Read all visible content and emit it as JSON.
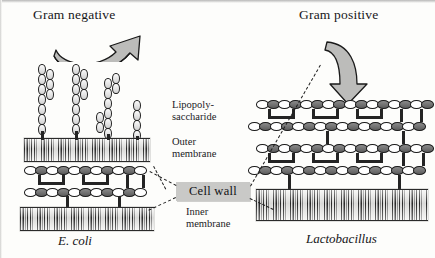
{
  "figure": {
    "titles": {
      "left": "Gram negative",
      "right": "Gram positive"
    },
    "species": {
      "left": "E. coli",
      "right": "Lactobacillus"
    },
    "labels": {
      "lipopolysaccharide_line1": "Lipopoly-",
      "lipopolysaccharide_line2": "saccharide",
      "outer_membrane_line1": "Outer",
      "outer_membrane_line2": "membrane",
      "cell_wall": "Cell wall",
      "inner_membrane_line1": "Inner",
      "inner_membrane_line2": "membrane"
    },
    "colors": {
      "background": "#fdfdfb",
      "ink": "#1b1b1e",
      "callout_box_fill": "#c9c9c7",
      "arrow_fill": "#b9b9b7",
      "sugar_dark": "#6e6e6e",
      "sugar_light": "#ffffff"
    },
    "structure": {
      "gram_negative_layers": [
        "lipopolysaccharide",
        "outer membrane",
        "peptidoglycan cell wall (thin)",
        "inner membrane"
      ],
      "gram_positive_layers": [
        "peptidoglycan cell wall (thick, multilayer)",
        "inner membrane"
      ],
      "gram_negative_peptidoglycan_rows": 2,
      "gram_positive_peptidoglycan_rows": 4,
      "gram_negative_lps_chains": 4
    },
    "icons": {
      "arrow_left": "curved-arrow-up-right",
      "arrow_right": "curved-arrow-down"
    }
  }
}
